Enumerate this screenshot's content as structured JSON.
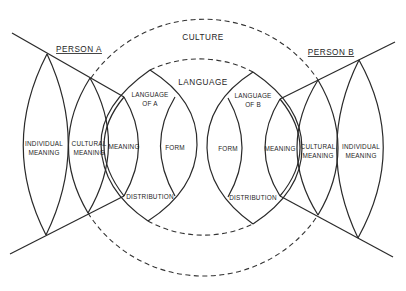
{
  "diagram": {
    "outer_circle_label": "CULTURE",
    "inner_circle_label": "LANGUAGE",
    "person_a": {
      "label": "PERSON A",
      "individual_meaning": [
        "INDIVIDUAL",
        "MEANING"
      ],
      "cultural_meaning": [
        "CULTURAL",
        "MEANING"
      ],
      "meaning": "MEANING",
      "language": [
        "LANGUAGE",
        "OF A"
      ],
      "form": "FORM",
      "distribution": "DISTRIBUTION"
    },
    "person_b": {
      "label": "PERSON B",
      "individual_meaning": [
        "INDIVIDUAL",
        "MEANING"
      ],
      "cultural_meaning": [
        "CULTURAL",
        "MEANING"
      ],
      "meaning": "MEANING",
      "language": [
        "LANGUAGE",
        "OF B"
      ],
      "form": "FORM",
      "distribution": "DISTRIBUTION"
    },
    "colors": {
      "ink": "#2a2a2a",
      "background": "#ffffff"
    }
  }
}
